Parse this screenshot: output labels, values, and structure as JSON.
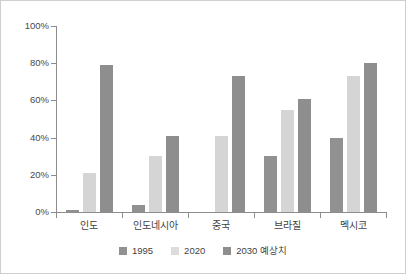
{
  "chart_data": {
    "type": "bar",
    "title": "",
    "subtitle": "",
    "xlabel": "",
    "ylabel": "",
    "ylim": [
      0,
      100
    ],
    "y_tick_labels": [
      "0%",
      "20%",
      "40%",
      "60%",
      "80%",
      "100%"
    ],
    "y_tick_values": [
      0,
      20,
      40,
      60,
      80,
      100
    ],
    "grid": false,
    "legend_position": "bottom-center",
    "value_unit": "%",
    "categories": [
      "인도",
      "인도네시아",
      "중국",
      "브라질",
      "멕시코"
    ],
    "series": [
      {
        "name": "1995",
        "color": "#919191",
        "values": [
          1,
          4,
          0,
          30,
          40
        ]
      },
      {
        "name": "2020",
        "color": "#d5d5d5",
        "values": [
          21,
          30,
          41,
          55,
          73
        ]
      },
      {
        "name": "2030 예상치",
        "color": "#8e8e8e",
        "values": [
          79,
          41,
          73,
          61,
          80
        ]
      }
    ]
  },
  "figure": {
    "border_color": "#cfcfcf",
    "background": "#ffffff",
    "axis_color": "#8c8c8c"
  }
}
